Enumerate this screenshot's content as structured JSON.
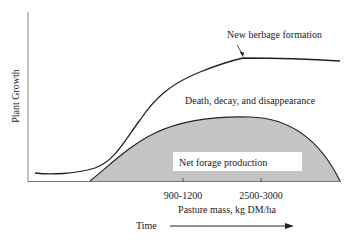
{
  "diagram": {
    "y_axis_label": "Plant Growth",
    "x_axis_label": "Pasture mass, kg DM/ha",
    "time_label": "Time",
    "ticks": [
      {
        "label": "900-1200",
        "x": 183
      },
      {
        "label": "2500-3000",
        "x": 261
      }
    ],
    "annotations": {
      "new_herbage": "New herbage formation",
      "death_decay": "Death, decay, and disappearance",
      "net_forage": "Net forage production"
    },
    "colors": {
      "shade": "#c4c4c4",
      "line": "#222222",
      "axis": "#888888"
    }
  }
}
